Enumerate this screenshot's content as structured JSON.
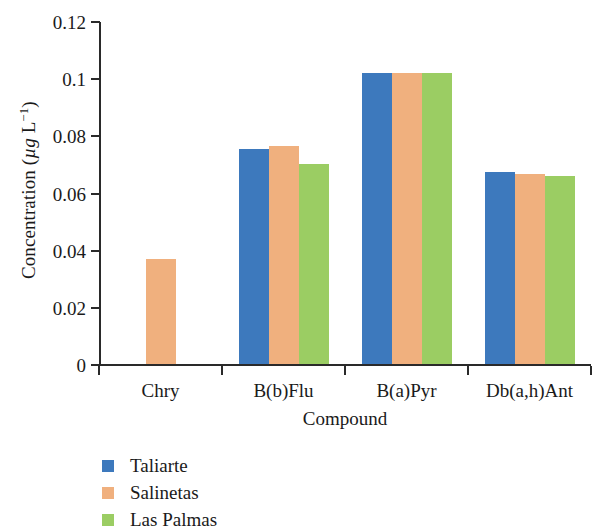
{
  "chart_data": {
    "type": "bar",
    "title": "",
    "subtitle": "",
    "xlabel": "Compound",
    "ylabel": "Concentration (µg L⁻¹)",
    "ylabel_parts": {
      "prefix": "Concentration (",
      "unit_italic": "µg",
      "unit_mid": " L",
      "unit_sup": "−1",
      "suffix": ")"
    },
    "categories": [
      "Chry",
      "B(b)Flu",
      "B(a)Pyr",
      "Db(a,h)Ant"
    ],
    "series": [
      {
        "name": "Taliarte",
        "color": "#3d79bd",
        "values": [
          null,
          0.0754,
          0.1021,
          0.0677
        ]
      },
      {
        "name": "Salinetas",
        "color": "#f0b07e",
        "values": [
          0.0372,
          0.0765,
          0.1021,
          0.0667
        ]
      },
      {
        "name": "Las Palmas",
        "color": "#9bcd63",
        "values": [
          null,
          0.0705,
          0.1021,
          0.066
        ]
      }
    ],
    "ylim": [
      0,
      0.12
    ],
    "ytick_values": [
      0,
      0.02,
      0.04,
      0.06,
      0.08,
      0.1,
      0.12
    ],
    "ytick_labels": [
      "0",
      "0.02",
      "0.04",
      "0.06",
      "0.08",
      "0.1",
      "0.12"
    ],
    "grid": false,
    "legend_position": "below-left",
    "legend": [
      "Taliarte",
      "Salinetas",
      "Las Palmas"
    ],
    "axis_color": "#2a2a2a"
  }
}
